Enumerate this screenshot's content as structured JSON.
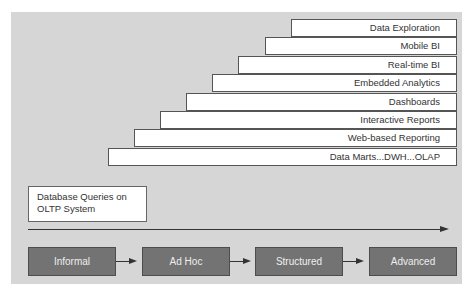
{
  "diagram": {
    "type": "maturity-evolution",
    "colors": {
      "panel_background": "#d6d6d6",
      "step_background": "#ffffff",
      "stage_background": "#737373",
      "stage_text": "#eeeeee",
      "line": "#333333"
    },
    "capability_steps": [
      {
        "label": "Data Exploration"
      },
      {
        "label": "Mobile BI"
      },
      {
        "label": "Real-time BI"
      },
      {
        "label": "Embedded Analytics"
      },
      {
        "label": "Dashboards"
      },
      {
        "label": "Interactive Reports"
      },
      {
        "label": "Web-based Reporting"
      },
      {
        "label": "Data Marts...DWH...OLAP"
      }
    ],
    "base_box": {
      "line1": "Database Queries on",
      "line2": "OLTP System"
    },
    "stages": [
      {
        "label": "Informal"
      },
      {
        "label": "Ad Hoc"
      },
      {
        "label": "Structured"
      },
      {
        "label": "Advanced"
      }
    ]
  }
}
